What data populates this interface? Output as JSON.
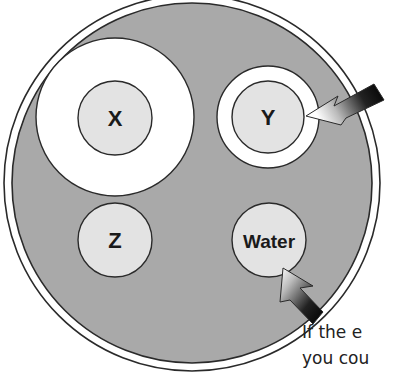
{
  "diagram": {
    "type": "cell-organelle-diagram",
    "cell": {
      "cytoplasm_color": "#a9a9a9",
      "membrane_color": "#ffffff",
      "outline_color": "#2a2a2a"
    },
    "organelles": [
      {
        "id": "x",
        "label": "X",
        "halo": "large"
      },
      {
        "id": "y",
        "label": "Y",
        "halo": "small"
      },
      {
        "id": "z",
        "label": "Z",
        "halo": "none"
      },
      {
        "id": "water",
        "label": "Water",
        "halo": "none"
      }
    ],
    "arrows": [
      {
        "target": "y",
        "direction": "inward"
      },
      {
        "target": "water",
        "direction": "inward"
      }
    ],
    "caption": {
      "line1": "If the e",
      "line2": "you cou"
    },
    "colors": {
      "organelle_fill": "#e3e3e3",
      "halo_fill": "#ffffff",
      "arrow_dark": "#111111",
      "arrow_light": "#ffffff"
    }
  }
}
